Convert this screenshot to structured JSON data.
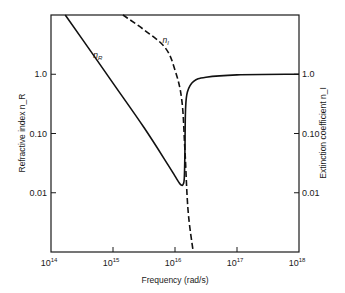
{
  "chart_data": {
    "type": "line",
    "title": "",
    "xlabel": "Frequency (rad/s)",
    "ylabel": "Refractive index n_R",
    "ylabel_right": "Extinction coefficient n_I",
    "xscale": "log",
    "yscale": "log",
    "xlim": [
      100000000000000.0,
      1e+18
    ],
    "ylim": [
      0.001,
      10
    ],
    "grid": false,
    "legend": "none (inline curve labels)",
    "x_ticks": [
      {
        "base": "10",
        "exp": "14",
        "log": 14
      },
      {
        "base": "10",
        "exp": "15",
        "log": 15
      },
      {
        "base": "10",
        "exp": "16",
        "log": 16
      },
      {
        "base": "10",
        "exp": "17",
        "log": 17
      },
      {
        "base": "10",
        "exp": "18",
        "log": 18
      }
    ],
    "y_ticks_left": [
      {
        "label": "1.0",
        "log": 0
      },
      {
        "label": "0.10",
        "log": -1
      },
      {
        "label": "0.01",
        "log": -2
      }
    ],
    "y_ticks_right": [
      {
        "label": "1.0",
        "log": 0
      },
      {
        "label": "0.10",
        "log": -1
      },
      {
        "label": "0.01",
        "log": -2
      }
    ],
    "series": [
      {
        "name": "n_R",
        "label_main": "n",
        "label_sub": "R",
        "style": "solid",
        "label_pos_log": [
          14.68,
          0.27
        ],
        "log_points": [
          [
            14.23,
            1.0
          ],
          [
            14.6,
            0.45
          ],
          [
            15.0,
            -0.15
          ],
          [
            15.5,
            -0.9
          ],
          [
            15.9,
            -1.55
          ],
          [
            16.0,
            -1.72
          ],
          [
            16.06,
            -1.82
          ],
          [
            16.1,
            -1.87
          ],
          [
            16.13,
            -1.86
          ],
          [
            16.15,
            -1.75
          ],
          [
            16.16,
            -1.3
          ],
          [
            16.17,
            -0.6
          ],
          [
            16.2,
            -0.3
          ],
          [
            16.3,
            -0.12
          ],
          [
            16.5,
            -0.05
          ],
          [
            17.0,
            -0.01
          ],
          [
            18.0,
            0.0
          ]
        ]
      },
      {
        "name": "n_I",
        "label_main": "n",
        "label_sub": "I",
        "style": "dashed",
        "label_pos_log": [
          15.8,
          0.52
        ],
        "log_points": [
          [
            15.16,
            1.0
          ],
          [
            15.5,
            0.75
          ],
          [
            15.84,
            0.45
          ],
          [
            16.0,
            0.07
          ],
          [
            16.11,
            -0.44
          ],
          [
            16.16,
            -1.28
          ],
          [
            16.21,
            -2.29
          ],
          [
            16.29,
            -2.97
          ]
        ]
      }
    ]
  }
}
